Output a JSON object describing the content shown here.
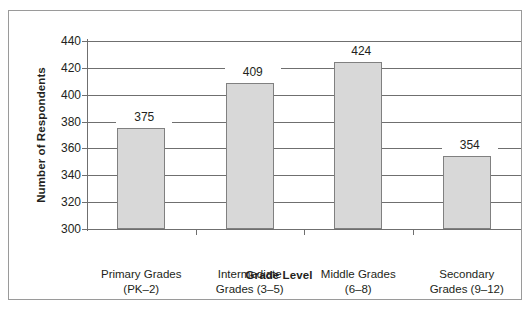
{
  "chart_data": {
    "type": "bar",
    "title": "",
    "xlabel": "Grade Level",
    "ylabel": "Number of Respondents",
    "categories": [
      "Primary Grades (PK–2)",
      "Intermediate Grades (3–5)",
      "Middle Grades (6–8)",
      "Secondary Grades (9–12)"
    ],
    "category_lines": [
      [
        "Primary Grades",
        "(PK–2)"
      ],
      [
        "Intermediate",
        "Grades (3–5)"
      ],
      [
        "Middle Grades",
        "(6–8)"
      ],
      [
        "Secondary",
        "Grades (9–12)"
      ]
    ],
    "values": [
      375,
      409,
      424,
      354
    ],
    "value_labels": [
      "375",
      "409",
      "424",
      "354"
    ],
    "ylim": [
      300,
      440
    ],
    "ytick_step": 20,
    "ytick_labels": [
      "440",
      "420",
      "400",
      "380",
      "360",
      "340",
      "320",
      "300"
    ],
    "grid": true,
    "legend": "none",
    "bar_fill_color": "#d8d8d8",
    "bar_border_color": "#808080",
    "axis_color": "#6f6f6f",
    "text_color": "#231f20"
  }
}
